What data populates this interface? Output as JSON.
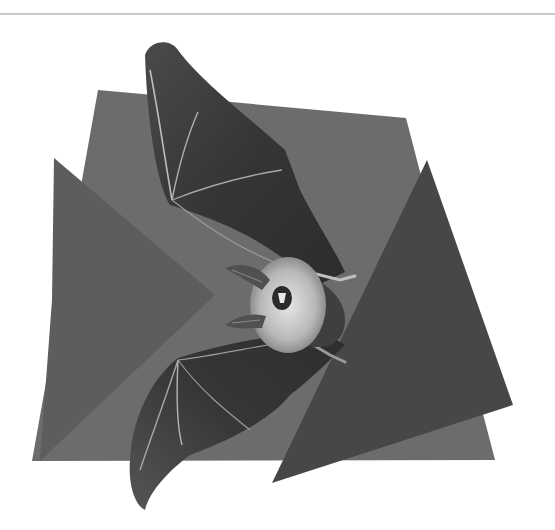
{
  "image": {
    "subject": "bat in flight over overlapping gray geometric shapes",
    "width": 555,
    "height": 530,
    "background": "#ffffff"
  },
  "colors": {
    "rule": "#c4c4c4",
    "back_panel": "#6c6c6c",
    "left_triangle": "#5c5c5c",
    "right_triangle": "#474747",
    "wing_membrane": "#3a3a3a",
    "wing_membrane_light": "#5a5a5a",
    "wing_bones": "#bdbdbd",
    "fur": "#d8d8d8",
    "fur_shadow": "#8a8a8a",
    "ear": "#4c4c4c",
    "face": "#2a2a2a"
  },
  "shapes": {
    "back_panel": "98,90 406,118 495,460 32,461",
    "left_triangle": "54,158 215,295 58,440 40,461 52,300",
    "right_triangle": "427,160 513,405 272,483"
  }
}
